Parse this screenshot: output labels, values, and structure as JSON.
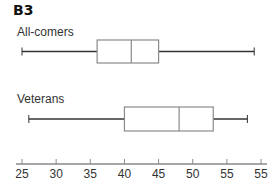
{
  "panel_label": "B3",
  "chart_data": {
    "type": "boxplot",
    "title": "B3",
    "orientation": "horizontal",
    "xlabel": "",
    "ylabel": "",
    "xlim": [
      25,
      60
    ],
    "x_ticks": [
      25,
      30,
      35,
      40,
      45,
      50,
      55,
      60
    ],
    "x_tick_labels": [
      "25",
      "30",
      "35",
      "40",
      "45",
      "50",
      "55",
      "55"
    ],
    "grid": false,
    "legend": null,
    "series": [
      {
        "name": "All-comers",
        "whisker_low": 25,
        "q1": 36,
        "median": 41,
        "q3": 45,
        "whisker_high": 59
      },
      {
        "name": "Veterans",
        "whisker_low": 26,
        "q1": 40,
        "median": 48,
        "q3": 53,
        "whisker_high": 58
      }
    ]
  },
  "colors": {
    "whisker": "#333333",
    "box_border": "#8a8a8a",
    "axis": "#8a8a8a"
  }
}
